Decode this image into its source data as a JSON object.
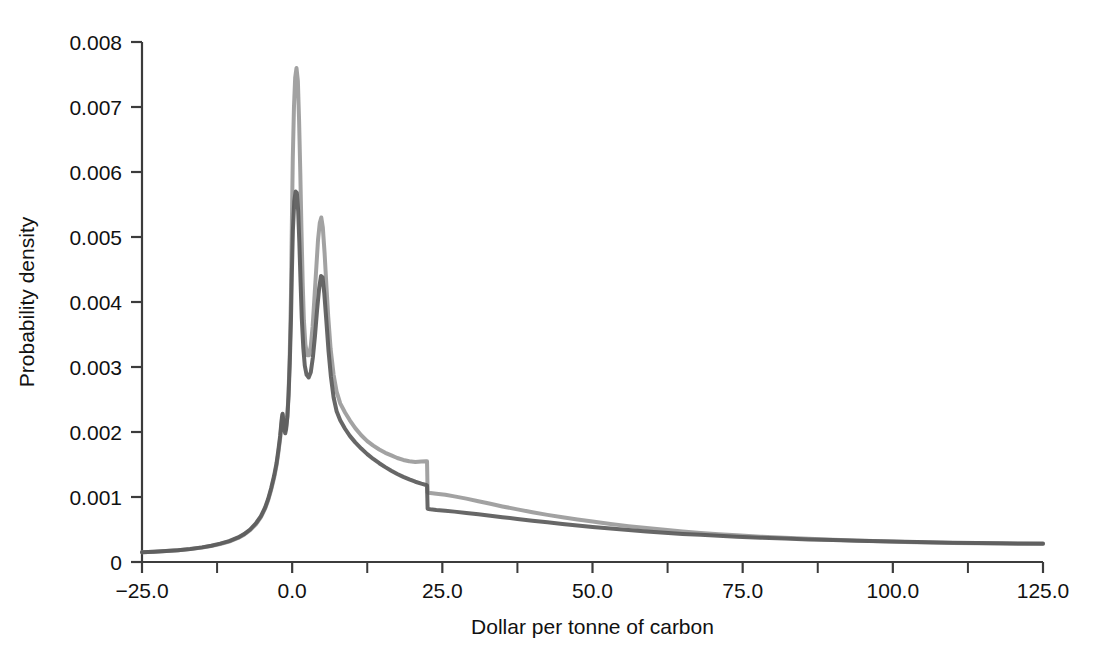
{
  "figure": {
    "background": "#ffffff",
    "width": 1094,
    "height": 652
  },
  "axes": {
    "x_title": "Dollar per tonne of carbon",
    "y_title": "Probability density",
    "x_tick_labels": [
      "-25.0",
      "0.0",
      "25.0",
      "50.0",
      "75.0",
      "100.0",
      "125.0"
    ],
    "x_tick_values": [
      -25,
      0,
      25,
      50,
      75,
      100,
      125
    ],
    "x_minor_tick_values": [
      -12.5,
      12.5,
      37.5,
      62.5,
      87.5,
      112.5
    ],
    "y_tick_labels": [
      "0",
      "0.001",
      "0.002",
      "0.003",
      "0.004",
      "0.005",
      "0.006",
      "0.007",
      "0.008"
    ],
    "y_tick_values": [
      0,
      0.001,
      0.002,
      0.003,
      0.004,
      0.005,
      0.006,
      0.007,
      0.008
    ],
    "axis_color": "#3c3c3c",
    "grid": false
  },
  "chart_data": {
    "type": "line",
    "title": "",
    "subtitle": "",
    "xlabel": "Dollar per tonne of carbon",
    "ylabel": "Probability density",
    "xlim": [
      -25,
      125
    ],
    "ylim": [
      0,
      0.008
    ],
    "grid": false,
    "legend_position": "none",
    "xticks": [
      -25,
      0,
      25,
      50,
      75,
      100,
      125
    ],
    "yticks": [
      0,
      0.001,
      0.002,
      0.003,
      0.004,
      0.005,
      0.006,
      0.007,
      0.008
    ],
    "series": [
      {
        "name": "density-light",
        "color": "#9a9a9a",
        "linewidth": 4,
        "points": [
          [
            -25.0,
            0.00015
          ],
          [
            -23.0,
            0.000158
          ],
          [
            -21.0,
            0.000168
          ],
          [
            -19.0,
            0.00018
          ],
          [
            -17.0,
            0.000198
          ],
          [
            -15.0,
            0.000222
          ],
          [
            -13.5,
            0.000245
          ],
          [
            -12.0,
            0.000275
          ],
          [
            -10.5,
            0.000315
          ],
          [
            -9.0,
            0.00037
          ],
          [
            -8.0,
            0.00042
          ],
          [
            -7.0,
            0.00049
          ],
          [
            -6.0,
            0.000585
          ],
          [
            -5.2,
            0.00069
          ],
          [
            -4.5,
            0.00082
          ],
          [
            -4.0,
            0.00095
          ],
          [
            -3.5,
            0.00111
          ],
          [
            -3.0,
            0.0013
          ],
          [
            -2.6,
            0.00149
          ],
          [
            -2.3,
            0.00168
          ],
          [
            -2.0,
            0.0019
          ],
          [
            -1.85,
            0.00205
          ],
          [
            -1.7,
            0.0022
          ],
          [
            -1.6,
            0.00227
          ],
          [
            -1.45,
            0.00218
          ],
          [
            -1.3,
            0.00207
          ],
          [
            -1.15,
            0.00202
          ],
          [
            -1.0,
            0.00208
          ],
          [
            -0.8,
            0.00225
          ],
          [
            -0.6,
            0.0026
          ],
          [
            -0.4,
            0.0032
          ],
          [
            -0.2,
            0.0041
          ],
          [
            -0.05,
            0.0052
          ],
          [
            0.1,
            0.0062
          ],
          [
            0.3,
            0.007
          ],
          [
            0.5,
            0.00745
          ],
          [
            0.72,
            0.0076
          ],
          [
            0.95,
            0.0074
          ],
          [
            1.15,
            0.0068
          ],
          [
            1.35,
            0.006
          ],
          [
            1.55,
            0.0051
          ],
          [
            1.75,
            0.0043
          ],
          [
            1.95,
            0.00372
          ],
          [
            2.2,
            0.00335
          ],
          [
            2.5,
            0.00318
          ],
          [
            2.8,
            0.00318
          ],
          [
            3.1,
            0.00332
          ],
          [
            3.4,
            0.00362
          ],
          [
            3.7,
            0.00405
          ],
          [
            4.0,
            0.0045
          ],
          [
            4.3,
            0.00495
          ],
          [
            4.6,
            0.00522
          ],
          [
            4.85,
            0.0053
          ],
          [
            5.1,
            0.00515
          ],
          [
            5.4,
            0.00475
          ],
          [
            5.7,
            0.00425
          ],
          [
            6.0,
            0.00378
          ],
          [
            6.4,
            0.00328
          ],
          [
            6.9,
            0.00288
          ],
          [
            7.4,
            0.00262
          ],
          [
            8.0,
            0.00244
          ],
          [
            8.8,
            0.0023
          ],
          [
            9.6,
            0.00218
          ],
          [
            10.5,
            0.00206
          ],
          [
            11.5,
            0.00195
          ],
          [
            12.5,
            0.00186
          ],
          [
            13.5,
            0.00179
          ],
          [
            14.5,
            0.00173
          ],
          [
            15.5,
            0.00168
          ],
          [
            16.5,
            0.00164
          ],
          [
            17.5,
            0.0016
          ],
          [
            18.5,
            0.00157
          ],
          [
            19.5,
            0.00155
          ],
          [
            20.5,
            0.00154
          ],
          [
            21.5,
            0.001545
          ],
          [
            22.3,
            0.00155
          ],
          [
            22.45,
            0.00155
          ],
          [
            22.55,
            0.00107
          ],
          [
            23.0,
            0.00106
          ],
          [
            24.0,
            0.00105
          ],
          [
            25.5,
            0.001035
          ],
          [
            27.0,
            0.00101
          ],
          [
            29.0,
            0.000975
          ],
          [
            31.0,
            0.000935
          ],
          [
            33.0,
            0.000895
          ],
          [
            35.0,
            0.000855
          ],
          [
            37.5,
            0.00081
          ],
          [
            40.0,
            0.000765
          ],
          [
            42.5,
            0.000725
          ],
          [
            45.0,
            0.00069
          ],
          [
            47.5,
            0.000655
          ],
          [
            50.0,
            0.000622
          ],
          [
            53.0,
            0.000585
          ],
          [
            56.0,
            0.000552
          ],
          [
            59.0,
            0.000522
          ],
          [
            62.0,
            0.000495
          ],
          [
            65.0,
            0.00047
          ],
          [
            68.0,
            0.000448
          ],
          [
            71.0,
            0.000428
          ],
          [
            74.0,
            0.00041
          ],
          [
            78.0,
            0.00039
          ],
          [
            82.0,
            0.000372
          ],
          [
            86.0,
            0.000356
          ],
          [
            90.0,
            0.000342
          ],
          [
            94.0,
            0.00033
          ],
          [
            98.0,
            0.000318
          ],
          [
            102.0,
            0.000308
          ],
          [
            106.0,
            0.0003
          ],
          [
            110.0,
            0.000293
          ],
          [
            114.0,
            0.000288
          ],
          [
            118.0,
            0.000283
          ],
          [
            121.0,
            0.00028
          ],
          [
            125.0,
            0.000278
          ]
        ]
      },
      {
        "name": "density-dark",
        "color": "#5a5a5a",
        "linewidth": 4,
        "points": [
          [
            -25.0,
            0.00015
          ],
          [
            -23.0,
            0.000158
          ],
          [
            -21.0,
            0.000168
          ],
          [
            -19.0,
            0.000182
          ],
          [
            -17.0,
            0.0002
          ],
          [
            -15.0,
            0.000225
          ],
          [
            -13.5,
            0.00025
          ],
          [
            -12.0,
            0.000282
          ],
          [
            -10.5,
            0.000322
          ],
          [
            -9.0,
            0.000378
          ],
          [
            -8.0,
            0.00043
          ],
          [
            -7.0,
            0.0005
          ],
          [
            -6.0,
            0.0006
          ],
          [
            -5.2,
            0.000705
          ],
          [
            -4.5,
            0.00084
          ],
          [
            -4.0,
            0.00097
          ],
          [
            -3.5,
            0.001135
          ],
          [
            -3.0,
            0.00133
          ],
          [
            -2.6,
            0.00152
          ],
          [
            -2.3,
            0.00172
          ],
          [
            -2.0,
            0.00194
          ],
          [
            -1.85,
            0.00209
          ],
          [
            -1.7,
            0.00223
          ],
          [
            -1.6,
            0.00228
          ],
          [
            -1.45,
            0.00215
          ],
          [
            -1.3,
            0.00202
          ],
          [
            -1.15,
            0.00198
          ],
          [
            -1.0,
            0.00205
          ],
          [
            -0.8,
            0.00223
          ],
          [
            -0.6,
            0.00256
          ],
          [
            -0.4,
            0.00305
          ],
          [
            -0.2,
            0.00372
          ],
          [
            -0.05,
            0.00445
          ],
          [
            0.12,
            0.0051
          ],
          [
            0.35,
            0.00555
          ],
          [
            0.58,
            0.0057
          ],
          [
            0.78,
            0.00568
          ],
          [
            1.0,
            0.0054
          ],
          [
            1.2,
            0.0049
          ],
          [
            1.4,
            0.0043
          ],
          [
            1.6,
            0.00375
          ],
          [
            1.85,
            0.0033
          ],
          [
            2.1,
            0.00302
          ],
          [
            2.4,
            0.00288
          ],
          [
            2.75,
            0.00284
          ],
          [
            3.1,
            0.00292
          ],
          [
            3.45,
            0.00315
          ],
          [
            3.8,
            0.00348
          ],
          [
            4.15,
            0.00388
          ],
          [
            4.5,
            0.00422
          ],
          [
            4.8,
            0.0044
          ],
          [
            5.05,
            0.00438
          ],
          [
            5.35,
            0.00413
          ],
          [
            5.7,
            0.0037
          ],
          [
            6.05,
            0.00325
          ],
          [
            6.45,
            0.00285
          ],
          [
            6.9,
            0.00253
          ],
          [
            7.4,
            0.00232
          ],
          [
            8.0,
            0.00218
          ],
          [
            8.8,
            0.00205
          ],
          [
            9.6,
            0.00194
          ],
          [
            10.5,
            0.00184
          ],
          [
            11.5,
            0.001745
          ],
          [
            12.5,
            0.00166
          ],
          [
            13.5,
            0.001585
          ],
          [
            14.5,
            0.00152
          ],
          [
            15.5,
            0.00146
          ],
          [
            16.5,
            0.001405
          ],
          [
            17.5,
            0.001355
          ],
          [
            18.5,
            0.00131
          ],
          [
            19.5,
            0.00127
          ],
          [
            20.5,
            0.001235
          ],
          [
            21.5,
            0.001205
          ],
          [
            22.3,
            0.001185
          ],
          [
            22.45,
            0.00118
          ],
          [
            22.55,
            0.00082
          ],
          [
            23.0,
            0.000812
          ],
          [
            24.0,
            0.0008
          ],
          [
            25.5,
            0.000788
          ],
          [
            27.0,
            0.000775
          ],
          [
            29.0,
            0.000755
          ],
          [
            31.0,
            0.000735
          ],
          [
            33.0,
            0.000712
          ],
          [
            35.0,
            0.00069
          ],
          [
            37.5,
            0.000662
          ],
          [
            40.0,
            0.000635
          ],
          [
            42.5,
            0.00061
          ],
          [
            45.0,
            0.000585
          ],
          [
            47.5,
            0.000562
          ],
          [
            50.0,
            0.00054
          ],
          [
            53.0,
            0.000515
          ],
          [
            56.0,
            0.000492
          ],
          [
            59.0,
            0.00047
          ],
          [
            62.0,
            0.00045
          ],
          [
            65.0,
            0.000432
          ],
          [
            68.0,
            0.000418
          ],
          [
            71.0,
            0.000404
          ],
          [
            74.0,
            0.00039
          ],
          [
            78.0,
            0.000374
          ],
          [
            82.0,
            0.00036
          ],
          [
            86.0,
            0.000348
          ],
          [
            90.0,
            0.000337
          ],
          [
            94.0,
            0.000327
          ],
          [
            98.0,
            0.000318
          ],
          [
            102.0,
            0.00031
          ],
          [
            106.0,
            0.000303
          ],
          [
            110.0,
            0.000297
          ],
          [
            114.0,
            0.000292
          ],
          [
            118.0,
            0.000288
          ],
          [
            121.0,
            0.000285
          ],
          [
            125.0,
            0.000283
          ]
        ]
      }
    ]
  }
}
